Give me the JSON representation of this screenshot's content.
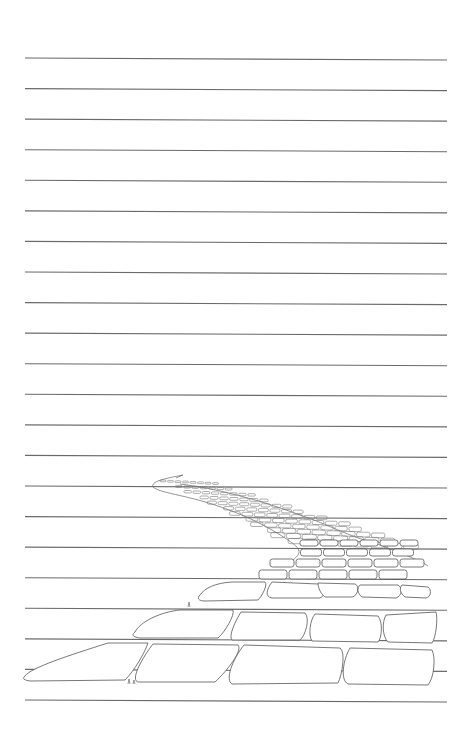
{
  "page": {
    "background": "#ffffff",
    "rule_color": "#6a6a6a",
    "ruled_lines": {
      "count": 22,
      "first_y": 58,
      "last_y": 700,
      "x_start": 25,
      "x_end": 447
    }
  },
  "illustration": {
    "subject": "brick-road-sketch",
    "style": "pencil line drawing"
  }
}
